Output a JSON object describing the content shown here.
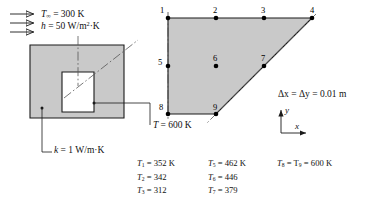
{
  "figure": {
    "colors": {
      "solid_fill": "#c9c9c9",
      "line": "#1a1a1a",
      "node": "#000000",
      "background": "#ffffff"
    }
  },
  "left_panel": {
    "convection": {
      "arrow_count": 3,
      "arrow_icon": "flow-arrow-icon",
      "t_inf_symbol": "T",
      "t_inf_subscript": "∞",
      "t_inf_eq": "= 300 K",
      "h_symbol": "h",
      "h_eq": "= 50 W/m",
      "h_exponent": "2",
      "h_unit_tail": "·K"
    },
    "conductivity": {
      "symbol": "k",
      "value": "= 1 W/m·K"
    },
    "surface_temp": {
      "symbol": "T",
      "value": "= 600 K"
    }
  },
  "right_panel": {
    "mesh": {
      "nodes": [
        {
          "id": "1",
          "x": 0,
          "y": 0,
          "label_dx": -8,
          "label_dy": -11
        },
        {
          "id": "2",
          "x": 2,
          "y": 0,
          "label_dx": -3,
          "label_dy": -11
        },
        {
          "id": "3",
          "x": 4,
          "y": 0,
          "label_dx": -3,
          "label_dy": -11
        },
        {
          "id": "4",
          "x": 6,
          "y": 0,
          "label_dx": -2,
          "label_dy": -11
        },
        {
          "id": "5",
          "x": 0,
          "y": 2,
          "label_dx": -9,
          "label_dy": -4
        },
        {
          "id": "6",
          "x": 2,
          "y": 2,
          "label_dx": -3,
          "label_dy": -11
        },
        {
          "id": "7",
          "x": 4,
          "y": 2,
          "label_dx": -3,
          "label_dy": -11
        },
        {
          "id": "8",
          "x": 0,
          "y": 4,
          "label_dx": -8,
          "label_dy": -4
        },
        {
          "id": "9",
          "x": 2,
          "y": 4,
          "label_dx": -3,
          "label_dy": -11
        }
      ],
      "outline": "trapezoid with vertical left symmetry edge, horizontal top and bottom edges, and a 45-degree diagonal from node 4 down-left to node 9",
      "symmetry_edge": "left vertical dash-dot centerline"
    },
    "spacing": {
      "text": "Δx = Δy = 0.01 m"
    },
    "axes": {
      "y_label": "y",
      "x_label": "x"
    }
  },
  "results_table": {
    "columns": [
      [
        {
          "symbol": "T",
          "sub": "1",
          "value": "= 352 K"
        },
        {
          "symbol": "T",
          "sub": "2",
          "value": "= 342"
        },
        {
          "symbol": "T",
          "sub": "3",
          "value": "= 312"
        }
      ],
      [
        {
          "symbol": "T",
          "sub": "5",
          "value": "= 462 K"
        },
        {
          "symbol": "T",
          "sub": "6",
          "value": "= 446"
        },
        {
          "symbol": "T",
          "sub": "7",
          "value": "= 379"
        }
      ],
      [
        {
          "symbol": "T",
          "sub": "8",
          "value": "= T",
          "value_sub": "9",
          "value_tail": "= 600 K"
        }
      ]
    ]
  }
}
